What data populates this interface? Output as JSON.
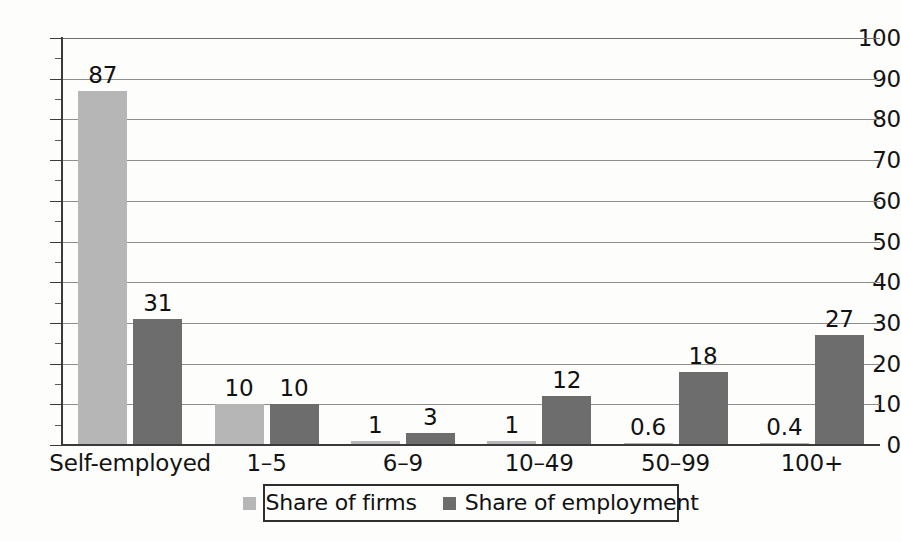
{
  "chart_data": {
    "type": "bar",
    "title": "",
    "xlabel": "",
    "ylabel": "",
    "ylim": [
      0,
      100
    ],
    "ytick_step": 10,
    "yticks": [
      0,
      10,
      20,
      30,
      40,
      50,
      60,
      70,
      80,
      90,
      100
    ],
    "ytick_labels": [
      "0",
      "10",
      "20",
      "30",
      "40",
      "50",
      "60",
      "70",
      "80",
      "90",
      "100"
    ],
    "minor_tick_step": 5,
    "grid": true,
    "grid_axis": "y",
    "legend_position": "bottom-center",
    "categories": [
      "Self-employed",
      "1–5",
      "6–9",
      "10–49",
      "50–99",
      "100+"
    ],
    "series": [
      {
        "name": "Share of firms",
        "color": "#b6b6b6",
        "values": [
          87,
          10,
          1,
          1,
          0.6,
          0.4
        ],
        "labels": [
          "87",
          "10",
          "1",
          "1",
          "0.6",
          "0.4"
        ]
      },
      {
        "name": "Share of employment",
        "color": "#6d6d6d",
        "values": [
          31,
          10,
          3,
          12,
          18,
          27
        ],
        "labels": [
          "31",
          "10",
          "3",
          "12",
          "18",
          "27"
        ]
      }
    ]
  },
  "legend": {
    "entries": [
      {
        "label": "Share of firms",
        "swatch": "firms"
      },
      {
        "label": "Share of employment",
        "swatch": "employment"
      }
    ]
  },
  "colors": {
    "firms": "#b6b6b6",
    "employment": "#6d6d6d",
    "axis": "#3a3a3a",
    "grid": "#8e8e8e",
    "text": "#111111",
    "background": "#fdfdfc"
  }
}
